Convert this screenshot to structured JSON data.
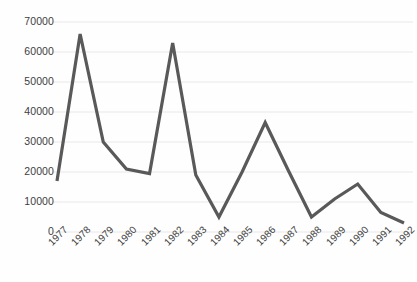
{
  "chart_data": {
    "type": "line",
    "title": "",
    "subtitle": "",
    "xlabel": "",
    "ylabel": "",
    "categories": [
      "1977",
      "1978",
      "1979",
      "1980",
      "1981",
      "1982",
      "1983",
      "1984",
      "1985",
      "1986",
      "1987",
      "1988",
      "1989",
      "1990",
      "1991",
      "1992"
    ],
    "values": [
      17000,
      66000,
      30000,
      21000,
      19500,
      63000,
      19000,
      5000,
      20000,
      36500,
      20500,
      5000,
      11000,
      16000,
      6500,
      3000
    ],
    "series": [
      {
        "name": "",
        "values": [
          17000,
          66000,
          30000,
          21000,
          19500,
          63000,
          19000,
          5000,
          20000,
          36500,
          20500,
          5000,
          11000,
          16000,
          6500,
          3000
        ]
      }
    ],
    "ylim": [
      0,
      70000
    ],
    "yticks": [
      0,
      10000,
      20000,
      30000,
      40000,
      50000,
      60000,
      70000
    ],
    "ytick_labels": [
      "0",
      "10000",
      "20000",
      "30000",
      "40000",
      "50000",
      "60000",
      "70000"
    ],
    "grid": true,
    "grid_axis": "y",
    "legend": false,
    "legend_position": "none",
    "line_color": "#595959",
    "line_width": 3.2,
    "grid_color": "#e8e8e8",
    "background_color": "#ffffff",
    "text_color": "#3d3d3d",
    "markers": false,
    "annotations": []
  },
  "layout": {
    "plot_left": 57,
    "plot_right": 404,
    "plot_top": 22,
    "plot_bottom": 232,
    "xtick_rotation_deg": -45
  }
}
